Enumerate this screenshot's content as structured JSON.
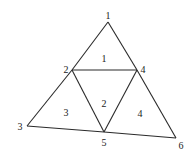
{
  "diagram": {
    "type": "triangular-mesh",
    "colors": {
      "edge": "#2a2a2a",
      "text": "#222222",
      "background": "#ffffff"
    },
    "nodes": [
      {
        "id": "1",
        "label": "1",
        "x": 108,
        "y": 22,
        "label_x": 108,
        "label_y": 19
      },
      {
        "id": "2",
        "label": "2",
        "x": 72,
        "y": 70,
        "label_x": 66,
        "label_y": 73
      },
      {
        "id": "3",
        "label": "3",
        "x": 27,
        "y": 126,
        "label_x": 20,
        "label_y": 130
      },
      {
        "id": "4",
        "label": "4",
        "x": 137,
        "y": 70,
        "label_x": 143,
        "label_y": 73
      },
      {
        "id": "5",
        "label": "5",
        "x": 104,
        "y": 132,
        "label_x": 104,
        "label_y": 146
      },
      {
        "id": "6",
        "label": "6",
        "x": 176,
        "y": 138,
        "label_x": 181,
        "label_y": 149
      }
    ],
    "edges": [
      [
        "1",
        "2"
      ],
      [
        "2",
        "3"
      ],
      [
        "1",
        "4"
      ],
      [
        "4",
        "6"
      ],
      [
        "3",
        "5"
      ],
      [
        "5",
        "6"
      ],
      [
        "2",
        "4"
      ],
      [
        "2",
        "5"
      ],
      [
        "4",
        "5"
      ]
    ],
    "elements": [
      {
        "id": "1",
        "label": "1",
        "nodes": [
          "1",
          "2",
          "4"
        ],
        "label_x": 104,
        "label_y": 62
      },
      {
        "id": "2",
        "label": "2",
        "nodes": [
          "2",
          "4",
          "5"
        ],
        "label_x": 104,
        "label_y": 107
      },
      {
        "id": "3",
        "label": "3",
        "nodes": [
          "2",
          "3",
          "5"
        ],
        "label_x": 66,
        "label_y": 116
      },
      {
        "id": "4",
        "label": "4",
        "nodes": [
          "4",
          "5",
          "6"
        ],
        "label_x": 140,
        "label_y": 117
      }
    ]
  }
}
